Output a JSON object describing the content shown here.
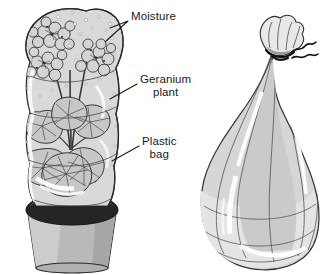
{
  "figure": {
    "background_color": "#ffffff",
    "ink_color": "#1a1a1a"
  },
  "labels": [
    {
      "id": "moisture",
      "text": "Moisture",
      "line1": "Moisture",
      "line2": "",
      "x": 131,
      "y": 16
    },
    {
      "id": "geranium",
      "text": "Geranium plant",
      "line1": "Geranium",
      "line2": "plant",
      "x": 140,
      "y": 79
    },
    {
      "id": "plastic",
      "text": "Plastic bag",
      "line1": "Plastic",
      "line2": "bag",
      "x": 142,
      "y": 141
    }
  ],
  "palette": {
    "bag_fill": "#d9d9d9",
    "bag_fill_light": "#e6e6e6",
    "bag_outline": "#333333",
    "highlight": "#ffffff",
    "pot_fill": "#b5b5b5",
    "pot_fill_light": "#cfcfcf",
    "pot_rim_dark": "#262626",
    "leaf_fill": "#c9c9c9",
    "flower_fill": "#d2d2d2",
    "tie_color": "#111111"
  },
  "scene": {
    "left": {
      "name": "potted-geranium-in-bag",
      "parts": [
        "plastic-bag",
        "moisture-droplets",
        "flower-clusters",
        "geranium-leaves",
        "stems",
        "flower-pot",
        "pot-rim-band"
      ]
    },
    "right": {
      "name": "tied-plastic-bag",
      "parts": [
        "plastic-bag",
        "gathered-neck",
        "twist-tie",
        "fold-creases",
        "highlights"
      ]
    }
  }
}
